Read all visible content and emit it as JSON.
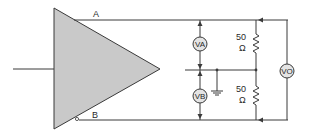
{
  "diagram": {
    "type": "circuit",
    "amplifier": {
      "shape": "triangle",
      "fill": "#c9c9c9"
    },
    "outputs": {
      "A": {
        "label": "A"
      },
      "B": {
        "label": "B",
        "inverted_marker": true
      }
    },
    "meters": {
      "VA": {
        "label": "VA"
      },
      "VB": {
        "label": "VB"
      },
      "VO": {
        "label": "VO"
      }
    },
    "resistors": {
      "top": {
        "value": "50",
        "unit": "Ω"
      },
      "bottom": {
        "value": "50",
        "unit": "Ω"
      }
    },
    "ground": {
      "present": true
    },
    "colors": {
      "wire": "#3a3a3a",
      "amplifier_fill": "#c9c9c9",
      "meter_fill": "#e4e4e4"
    }
  }
}
